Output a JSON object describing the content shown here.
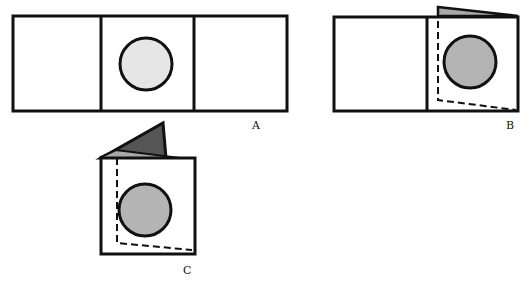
{
  "diagram": {
    "figures": [
      {
        "id": "A",
        "label": "A",
        "state": "flat three-panel strip, circle light gray"
      },
      {
        "id": "B",
        "label": "B",
        "state": "right panel folded over center, circle shown darker gray, dashed outline of hidden panel"
      },
      {
        "id": "C",
        "label": "C",
        "state": "both panels folded, dark triangular flap on top, dashed outline"
      }
    ],
    "colors": {
      "stroke": "#111111",
      "circle_light": "#e6e6e6",
      "circle_dark": "#b4b4b4",
      "flap_dark": "#555555",
      "flap_light": "#a8a8a8",
      "background": "#ffffff"
    }
  }
}
